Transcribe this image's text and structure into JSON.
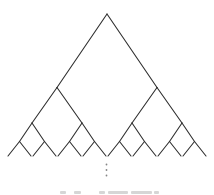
{
  "figure": {
    "kind": "infinite-binary-tree-diagram",
    "canvas": {
      "width": 214,
      "height": 195,
      "background": "#ffffff"
    },
    "stroke": {
      "color": "#2f2f2f",
      "width": 1.1
    },
    "tree": {
      "root": [
        107,
        14
      ],
      "level_y": [
        14,
        87.5,
        123,
        141.5,
        156
      ],
      "edges": [
        [
          107,
          14,
          57,
          87.5
        ],
        [
          107,
          14,
          157,
          87.5
        ],
        [
          57,
          87.5,
          32,
          123
        ],
        [
          57,
          87.5,
          82,
          123
        ],
        [
          157,
          87.5,
          132,
          123
        ],
        [
          157,
          87.5,
          182,
          123
        ],
        [
          32,
          123,
          19.5,
          141.5
        ],
        [
          32,
          123,
          44.5,
          141.5
        ],
        [
          82,
          123,
          69.5,
          141.5
        ],
        [
          82,
          123,
          94.5,
          141.5
        ],
        [
          132,
          123,
          119.5,
          141.5
        ],
        [
          132,
          123,
          144.5,
          141.5
        ],
        [
          182,
          123,
          169.5,
          141.5
        ],
        [
          182,
          123,
          194.5,
          141.5
        ],
        [
          19.5,
          141.5,
          8,
          156
        ],
        [
          19.5,
          141.5,
          31,
          156
        ],
        [
          44.5,
          141.5,
          33,
          156
        ],
        [
          44.5,
          141.5,
          56,
          156
        ],
        [
          69.5,
          141.5,
          58,
          156
        ],
        [
          69.5,
          141.5,
          81,
          156
        ],
        [
          94.5,
          141.5,
          83,
          156
        ],
        [
          94.5,
          141.5,
          106,
          156
        ],
        [
          119.5,
          141.5,
          108,
          156
        ],
        [
          119.5,
          141.5,
          131,
          156
        ],
        [
          144.5,
          141.5,
          133,
          156
        ],
        [
          144.5,
          141.5,
          156,
          156
        ],
        [
          169.5,
          141.5,
          158,
          156
        ],
        [
          169.5,
          141.5,
          181,
          156
        ],
        [
          194.5,
          141.5,
          183,
          156
        ],
        [
          194.5,
          141.5,
          206,
          156
        ]
      ]
    },
    "continuation_ellipsis": {
      "glyph": "⋮",
      "x": 106.5,
      "dots_y": [
        164.5,
        170,
        175.5
      ],
      "dot_radius": 0.9,
      "color": "#858585"
    },
    "clipped_caption": {
      "note": "tops of cropped caption text, illegible",
      "y": 191,
      "segments": [
        {
          "x": 60,
          "w": 6
        },
        {
          "x": 74,
          "w": 7
        },
        {
          "x": 99,
          "w": 6
        },
        {
          "x": 108,
          "w": 20
        },
        {
          "x": 131,
          "w": 21
        },
        {
          "x": 154,
          "w": 5
        }
      ]
    }
  }
}
